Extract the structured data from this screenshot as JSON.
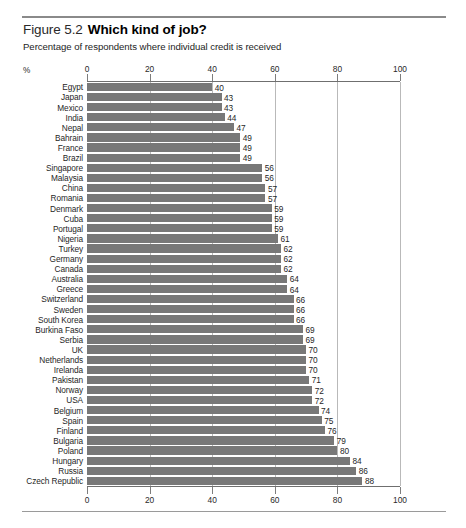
{
  "figure": {
    "number": "Figure 5.2",
    "title": "Which kind of job?",
    "subtitle": "Percentage of respondents where individual credit is received",
    "unit_label": "%"
  },
  "chart_data": {
    "type": "bar",
    "orientation": "horizontal",
    "title": "Which kind of job?",
    "subtitle": "Percentage of respondents where individual credit is received",
    "xlabel": "%",
    "ylabel": "",
    "xlim": [
      0,
      100
    ],
    "xticks": [
      0,
      20,
      40,
      60,
      80,
      100
    ],
    "xticklabels": [
      "0",
      "20",
      "40",
      "60",
      "80",
      "100"
    ],
    "axis_position": "both",
    "grid": true,
    "legend": "none",
    "bar_color": "#787878",
    "value_labels": true,
    "categories": [
      "Egypt",
      "Japan",
      "Mexico",
      "India",
      "Nepal",
      "Bahrain",
      "France",
      "Brazil",
      "Singapore",
      "Malaysia",
      "China",
      "Romania",
      "Denmark",
      "Cuba",
      "Portugal",
      "Nigeria",
      "Turkey",
      "Germany",
      "Canada",
      "Australia",
      "Greece",
      "Switzerland",
      "Sweden",
      "South Korea",
      "Burkina Faso",
      "Serbia",
      "UK",
      "Netherlands",
      "Irelanda",
      "Pakistan",
      "Norway",
      "USA",
      "Belgium",
      "Spain",
      "Finland",
      "Bulgaria",
      "Poland",
      "Hungary",
      "Russia",
      "Czech Republic"
    ],
    "values": [
      40,
      43,
      43,
      44,
      47,
      49,
      49,
      49,
      56,
      56,
      57,
      57,
      59,
      59,
      59,
      61,
      62,
      62,
      62,
      64,
      64,
      66,
      66,
      66,
      69,
      69,
      70,
      70,
      70,
      71,
      72,
      72,
      74,
      75,
      76,
      79,
      80,
      84,
      86,
      88
    ]
  }
}
